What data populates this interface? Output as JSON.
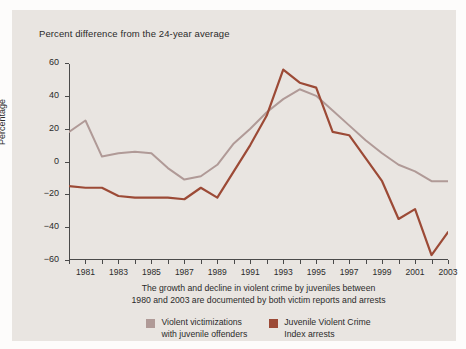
{
  "chart_data": {
    "type": "line",
    "title": "Percent difference from the 24-year average",
    "xlabel": "",
    "ylabel": "Percentage",
    "caption_line1": "The growth and decline in violent crime by juveniles between",
    "caption_line2": "1980 and 2003 are documented by both victim reports and arrests",
    "xlim": [
      1980,
      2003
    ],
    "ylim": [
      -60,
      60
    ],
    "grid": false,
    "legend_position": "bottom",
    "y_ticks": [
      60,
      40,
      20,
      0,
      -20,
      -40,
      -60
    ],
    "y_tick_labels": [
      "60",
      "40",
      "20",
      "0",
      "−20",
      "−40",
      "−60"
    ],
    "x_ticks": [
      1980,
      1981,
      1982,
      1983,
      1984,
      1985,
      1986,
      1987,
      1988,
      1989,
      1990,
      1991,
      1992,
      1993,
      1994,
      1995,
      1996,
      1997,
      1998,
      1999,
      2000,
      2001,
      2002,
      2003
    ],
    "x_tick_labels_shown": [
      "1981",
      "1983",
      "1985",
      "1987",
      "1989",
      "1991",
      "1993",
      "1995",
      "1997",
      "1999",
      "2001",
      "2003"
    ],
    "x": [
      1980,
      1981,
      1982,
      1983,
      1984,
      1985,
      1986,
      1987,
      1988,
      1989,
      1990,
      1991,
      1992,
      1993,
      1994,
      1995,
      1996,
      1997,
      1998,
      1999,
      2000,
      2001,
      2002,
      2003
    ],
    "series": [
      {
        "name": "Violent victimizations with juvenile offenders",
        "color": "#b09a97",
        "values": [
          18,
          25,
          3,
          5,
          6,
          5,
          -4,
          -11,
          -9,
          -2,
          11,
          20,
          30,
          38,
          44,
          40,
          31,
          22,
          13,
          5,
          -2,
          -6,
          -12,
          -12
        ]
      },
      {
        "name": "Juvenile Violent Crime Index arrests",
        "color": "#9c4a36",
        "values": [
          -15,
          -16,
          -16,
          -21,
          -22,
          -22,
          -22,
          -23,
          -16,
          -22,
          -6,
          10,
          28,
          56,
          48,
          45,
          18,
          16,
          2,
          -12,
          -35,
          -29,
          -57,
          -43
        ]
      }
    ],
    "legend": [
      {
        "label_line1": "Violent victimizations",
        "label_line2": "with juvenile offenders",
        "color": "#b09a97"
      },
      {
        "label_line1": "Juvenile Violent Crime",
        "label_line2": "Index arrests",
        "color": "#9c4a36"
      }
    ],
    "colors": {
      "figure_background": "#fdfcfb",
      "panel_background": "#e9e5e1",
      "axis": "#4a4a4a",
      "text": "#2b2b2b"
    }
  }
}
